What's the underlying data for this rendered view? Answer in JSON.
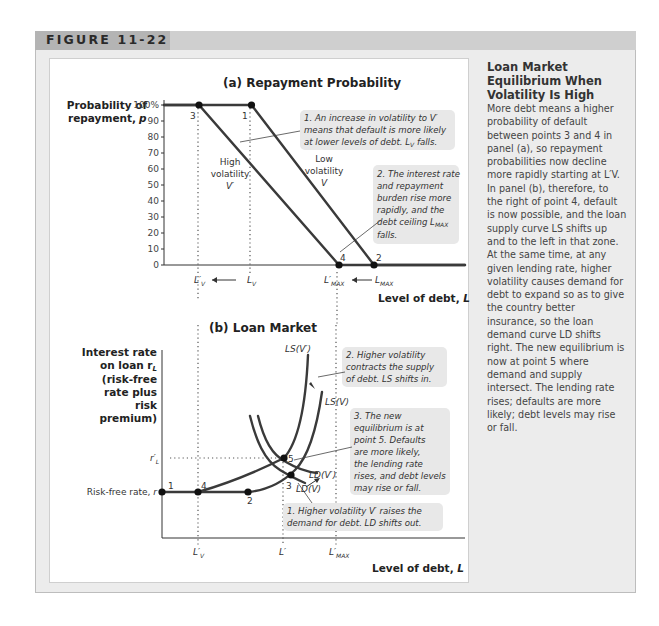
{
  "figure": {
    "label": "FIGURE 11-22"
  },
  "caption": {
    "title": "Loan Market Equilibrium When Volatility Is High",
    "body": "More debt means a higher probability of default between points 3 and 4 in panel (a), so repayment probabilities now decline more rapidly starting at L′V. In panel (b), therefore, to the right of point 4, default is now possible, and the loan supply curve LS shifts up and to the left in that zone. At the same time, at any given lending rate, higher volatility causes demand for debt to expand so as to give the country better insurance, so the loan demand curve LD shifts right. The new equilibrium is now at point 5 where demand and supply intersect. The lending rate rises; defaults are more likely; debt levels may rise or fall."
  },
  "chart_data": [
    {
      "type": "line",
      "title": "(a) Repayment Probability",
      "ylabel": "Probability of repayment, p",
      "xlabel": "Level of debt, L",
      "ylim": [
        0,
        100
      ],
      "yticks": [
        "0",
        "10",
        "20",
        "30",
        "40",
        "50",
        "60",
        "70",
        "80",
        "90",
        "100%"
      ],
      "xticks": [
        "L′V",
        "LV",
        "L′MAX",
        "LMAX"
      ],
      "x_positions": {
        "L'V": 1.0,
        "LV": 2.5,
        "L'MAX": 5.0,
        "LMAX": 6.0
      },
      "xlim": [
        0,
        8.6
      ],
      "series": [
        {
          "name": "High volatility V′",
          "points": [
            [
              0,
              100
            ],
            [
              1.0,
              100
            ],
            [
              5.0,
              0
            ],
            [
              8.6,
              0
            ]
          ]
        },
        {
          "name": "Low volatility V",
          "points": [
            [
              0,
              100
            ],
            [
              2.5,
              100
            ],
            [
              6.0,
              0
            ],
            [
              8.6,
              0
            ]
          ]
        }
      ],
      "curve_labels": [
        {
          "text": [
            "High",
            "volatility",
            "V′"
          ]
        },
        {
          "text": [
            "Low",
            "volatility",
            "V"
          ]
        }
      ],
      "points": [
        {
          "id": "3",
          "x": 1.0,
          "y": 100
        },
        {
          "id": "1",
          "x": 2.5,
          "y": 100
        },
        {
          "id": "4",
          "x": 5.0,
          "y": 0
        },
        {
          "id": "2",
          "x": 6.0,
          "y": 0
        }
      ],
      "annotations": [
        "1. An increase in volatility to V′ means that default is more likely at lower levels of debt. LV falls.",
        "2. The interest rate and repayment burden rise more rapidly, and the debt ceiling LMAX falls."
      ]
    },
    {
      "type": "line",
      "title": "(b) Loan Market",
      "ylabel": "Interest rate on loan rL (risk-free rate plus risk premium)",
      "xlabel": "Level of debt, L",
      "yticks": [
        "Risk-free rate, r",
        "r′L"
      ],
      "xticks": [
        "L′V",
        "L′",
        "L′MAX"
      ],
      "series": [
        {
          "name": "LS(V′)"
        },
        {
          "name": "LS(V)"
        },
        {
          "name": "LD(V′)"
        },
        {
          "name": "LD(V)"
        }
      ],
      "points": [
        {
          "id": "1",
          "label": "on risk-free rate at zero debt"
        },
        {
          "id": "4",
          "label": "at L′V on risk-free rate"
        },
        {
          "id": "2",
          "label": "LS(V) leaves risk-free rate"
        },
        {
          "id": "3",
          "label": "LD(V) meets LS(V)"
        },
        {
          "id": "5",
          "label": "new equilibrium, LD(V′) meets LS(V′) at r′L, L′"
        }
      ],
      "annotations": [
        "1. Higher volatility V′ raises the demand for debt. LD shifts out.",
        "2. Higher volatility contracts the supply of debt. LS shifts in.",
        "3. The new equilibrium is at point 5. Defaults are more likely, the lending rate rises, and debt levels may rise or fall."
      ]
    }
  ],
  "labels": {
    "a_title": "(a) Repayment Probability",
    "a_ylabel_1": "Probability of",
    "a_ylabel_2": "repayment,",
    "a_ylabel_var": "p",
    "a_xlabel": "Level of debt,",
    "a_xlabel_var": "L",
    "high_1": "High",
    "high_2": "volatility",
    "high_3": "V′",
    "low_1": "Low",
    "low_2": "volatility",
    "low_3": "V",
    "pt3": "3",
    "pt1": "1",
    "pt4": "4",
    "pt2": "2",
    "note_a1": [
      "1. An increase in volatility to V′",
      "means that default is more likely",
      "at lower levels of debt. L",
      "V",
      " falls."
    ],
    "note_a2": [
      "2. The interest rate",
      "and repayment",
      "burden rise more",
      "rapidly, and the",
      "debt ceiling L",
      "MAX",
      "falls."
    ],
    "b_title": "(b) Loan Market",
    "b_ylabel": [
      "Interest rate",
      "on loan r",
      "L",
      "(risk-free",
      "rate plus",
      "risk",
      "premium)"
    ],
    "b_xlabel": "Level of debt,",
    "b_xlabel_var": "L",
    "risk_free": "Risk-free rate,",
    "risk_free_var": "r",
    "rL_prime": "r′",
    "rL_sub": "L",
    "ls_vp": "LS(V′)",
    "ls_v": "LS(V)",
    "ld_vp": "LD(V′)",
    "ld_v": "LD(V)",
    "pt5": "5",
    "note_b1": [
      "1. Higher volatility V′ raises the",
      "demand for debt. LD shifts out."
    ],
    "note_b2": [
      "2. Higher volatility",
      "contracts the supply",
      "of debt. LS shifts in."
    ],
    "note_b3": [
      "3. The new",
      "equilibrium is at",
      "point 5. Defaults",
      "are more likely,",
      "the lending rate",
      "rises, and debt levels",
      "may rise or fall."
    ],
    "x_lv_prime": "L′",
    "x_lv": "L",
    "sub_v": "V",
    "x_lmax_prime": "L′",
    "x_lmax": "L",
    "sub_max": "MAX",
    "x_l_prime": "L′"
  }
}
